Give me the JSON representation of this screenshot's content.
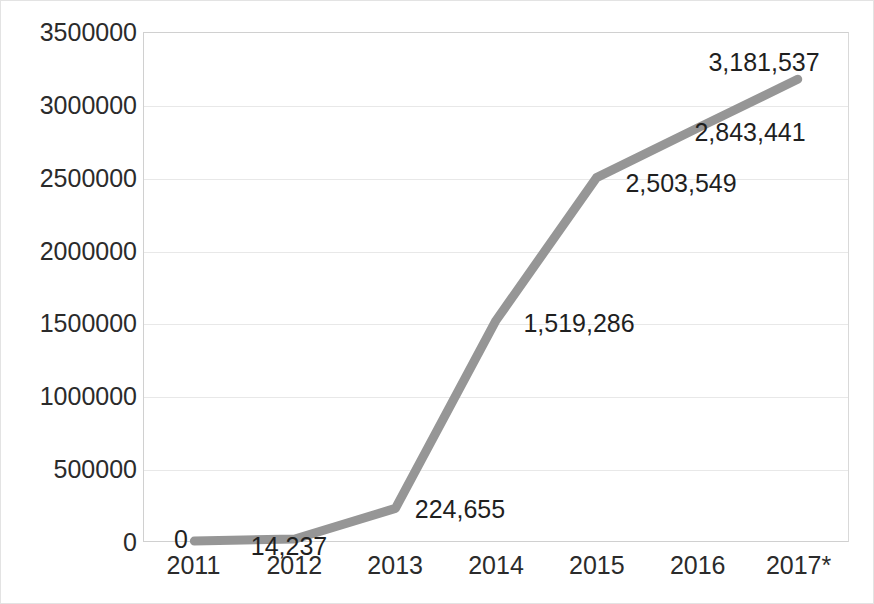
{
  "chart_data": {
    "type": "line",
    "title": "",
    "subtitle": "",
    "xlabel": "",
    "ylabel": "",
    "categories": [
      "2011",
      "2012",
      "2013",
      "2014",
      "2015",
      "2016",
      "2017*"
    ],
    "values": [
      0,
      14237,
      224655,
      1519286,
      2503549,
      2843441,
      3181537
    ],
    "value_labels": [
      "0",
      "14,237",
      "224,655",
      "1,519,286",
      "2,503,549",
      "2,843,441",
      "3,181,537"
    ],
    "series": [
      {
        "name": "",
        "values": [
          0,
          14237,
          224655,
          1519286,
          2503549,
          2843441,
          3181537
        ],
        "color": "#969696"
      }
    ],
    "ylim": [
      0,
      3500000
    ],
    "ytick_values": [
      0,
      500000,
      1000000,
      1500000,
      2000000,
      2500000,
      3000000,
      3500000
    ],
    "ytick_labels": [
      "0",
      "500000",
      "1000000",
      "1500000",
      "2000000",
      "2500000",
      "3000000",
      "3500000"
    ],
    "grid": "horizontal",
    "legend": "none",
    "annotations": [
      "2017* denotes estimated or provisional data"
    ],
    "colors": {
      "line": "#969696",
      "gridline": "#e8e8e8",
      "axis_text": "#2b2b2b",
      "label_text": "#1f1f1f",
      "plot_border": "#d0d0d0",
      "background": "#ffffff"
    }
  },
  "label_positions": [
    {
      "index": 0,
      "x": 180,
      "y": 538
    },
    {
      "index": 1,
      "x": 288,
      "y": 545
    },
    {
      "index": 2,
      "x": 459,
      "y": 508
    },
    {
      "index": 3,
      "x": 578,
      "y": 322
    },
    {
      "index": 4,
      "x": 680,
      "y": 182
    },
    {
      "index": 5,
      "x": 749,
      "y": 131
    },
    {
      "index": 6,
      "x": 763,
      "y": 61
    }
  ]
}
